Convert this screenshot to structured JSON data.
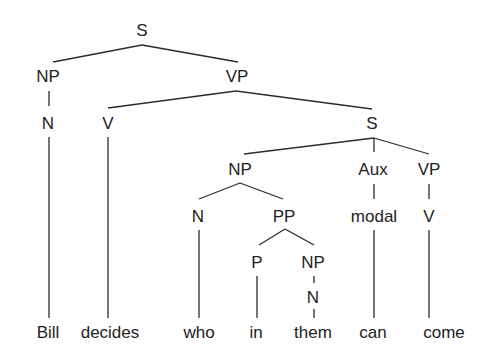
{
  "diagram": {
    "type": "syntax-tree",
    "sentence": [
      "Bill",
      "decides",
      "who",
      "in",
      "them",
      "can",
      "come"
    ],
    "nodes": [
      {
        "id": "s0",
        "label": "S",
        "x": 142,
        "y": 36
      },
      {
        "id": "np1",
        "label": "NP",
        "x": 48,
        "y": 82
      },
      {
        "id": "vp1",
        "label": "VP",
        "x": 237,
        "y": 82
      },
      {
        "id": "n1",
        "label": "N",
        "x": 48,
        "y": 129
      },
      {
        "id": "v1",
        "label": "V",
        "x": 108,
        "y": 129
      },
      {
        "id": "s1",
        "label": "S",
        "x": 372,
        "y": 129
      },
      {
        "id": "np2",
        "label": "NP",
        "x": 240,
        "y": 175
      },
      {
        "id": "aux",
        "label": "Aux",
        "x": 373,
        "y": 175
      },
      {
        "id": "vp2",
        "label": "VP",
        "x": 429,
        "y": 175
      },
      {
        "id": "n2",
        "label": "N",
        "x": 198,
        "y": 222
      },
      {
        "id": "pp",
        "label": "PP",
        "x": 284,
        "y": 222
      },
      {
        "id": "modal",
        "label": "modal",
        "x": 374,
        "y": 222
      },
      {
        "id": "v2",
        "label": "V",
        "x": 429,
        "y": 222
      },
      {
        "id": "p",
        "label": "P",
        "x": 257,
        "y": 268
      },
      {
        "id": "np3",
        "label": "NP",
        "x": 313,
        "y": 268
      },
      {
        "id": "n3",
        "label": "N",
        "x": 313,
        "y": 303
      },
      {
        "id": "w1",
        "label": "Bill",
        "x": 48,
        "y": 338
      },
      {
        "id": "w2",
        "label": "decides",
        "x": 110,
        "y": 338
      },
      {
        "id": "w3",
        "label": "who",
        "x": 199,
        "y": 338
      },
      {
        "id": "w4",
        "label": "in",
        "x": 256,
        "y": 338
      },
      {
        "id": "w5",
        "label": "them",
        "x": 313,
        "y": 338
      },
      {
        "id": "w6",
        "label": "can",
        "x": 373,
        "y": 338
      },
      {
        "id": "w7",
        "label": "come",
        "x": 444,
        "y": 338
      }
    ],
    "edges": [
      {
        "x1": 142,
        "y1": 45,
        "x2": 53,
        "y2": 62
      },
      {
        "x1": 142,
        "y1": 45,
        "x2": 238,
        "y2": 62
      },
      {
        "x1": 49,
        "y1": 91,
        "x2": 49,
        "y2": 106
      },
      {
        "x1": 236,
        "y1": 91,
        "x2": 108,
        "y2": 108
      },
      {
        "x1": 236,
        "y1": 91,
        "x2": 372,
        "y2": 109
      },
      {
        "x1": 49,
        "y1": 137,
        "x2": 49,
        "y2": 318
      },
      {
        "x1": 108,
        "y1": 137,
        "x2": 108,
        "y2": 318
      },
      {
        "x1": 374,
        "y1": 138,
        "x2": 244,
        "y2": 154
      },
      {
        "x1": 374,
        "y1": 138,
        "x2": 374,
        "y2": 152
      },
      {
        "x1": 374,
        "y1": 138,
        "x2": 429,
        "y2": 154
      },
      {
        "x1": 240,
        "y1": 183,
        "x2": 199,
        "y2": 199
      },
      {
        "x1": 240,
        "y1": 183,
        "x2": 283,
        "y2": 199
      },
      {
        "x1": 374,
        "y1": 184,
        "x2": 374,
        "y2": 199
      },
      {
        "x1": 429,
        "y1": 184,
        "x2": 429,
        "y2": 199
      },
      {
        "x1": 199,
        "y1": 230,
        "x2": 199,
        "y2": 318
      },
      {
        "x1": 285,
        "y1": 229,
        "x2": 259,
        "y2": 245
      },
      {
        "x1": 285,
        "y1": 229,
        "x2": 314,
        "y2": 245
      },
      {
        "x1": 374,
        "y1": 230,
        "x2": 374,
        "y2": 318
      },
      {
        "x1": 429,
        "y1": 230,
        "x2": 429,
        "y2": 318
      },
      {
        "x1": 257,
        "y1": 276,
        "x2": 257,
        "y2": 318
      },
      {
        "x1": 314,
        "y1": 276,
        "x2": 314,
        "y2": 283
      },
      {
        "x1": 314,
        "y1": 309,
        "x2": 314,
        "y2": 318
      }
    ]
  }
}
